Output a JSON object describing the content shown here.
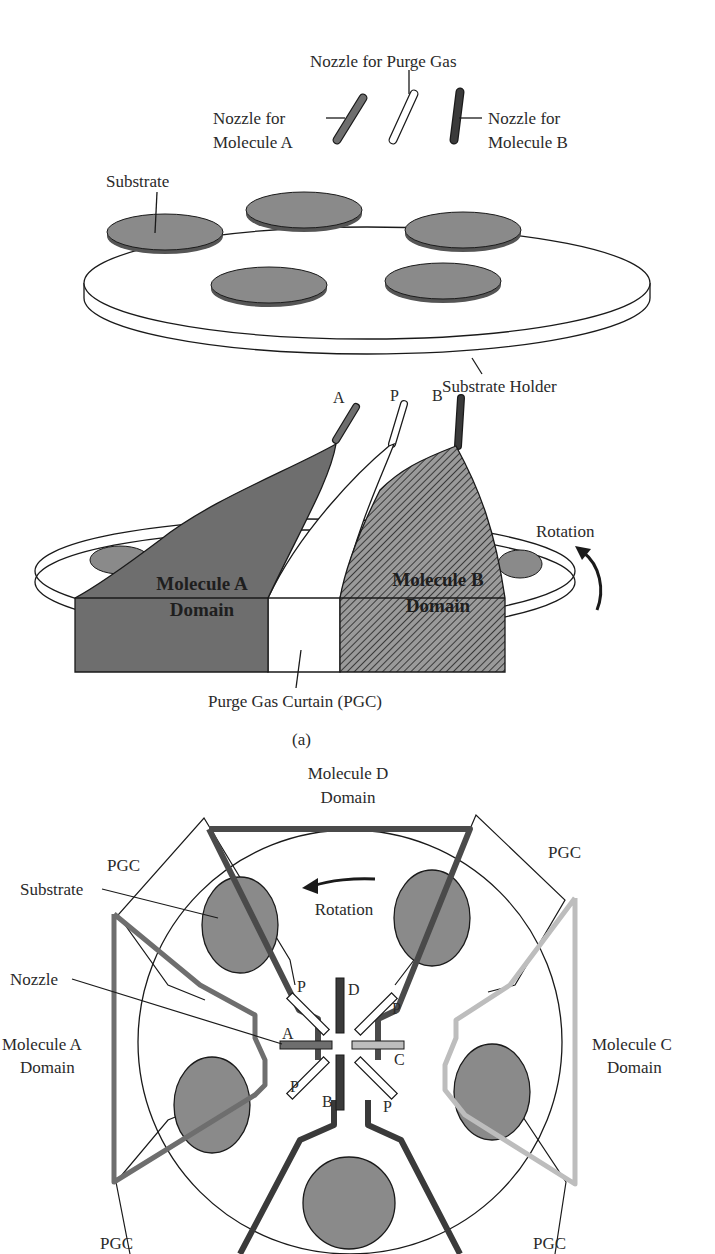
{
  "figure": {
    "part_a": {
      "caption": "(a)",
      "nozzle_labels": {
        "purge": "Nozzle for Purge Gas",
        "molecule_a_line1": "Nozzle for",
        "molecule_a_line2": "Molecule A",
        "molecule_b_line1": "Nozzle for",
        "molecule_b_line2": "Molecule B"
      },
      "substrate_label": "Substrate",
      "holder_label": "Substrate Holder",
      "nozzle_tags": {
        "a": "A",
        "p": "P",
        "b": "B"
      },
      "domain_a_line1": "Molecule A",
      "domain_a_line2": "Domain",
      "domain_b_line1": "Molecule B",
      "domain_b_line2": "Domain",
      "rotation_label": "Rotation",
      "pgc_label": "Purge Gas Curtain (PGC)"
    },
    "part_b": {
      "domain_d_line1": "Molecule D",
      "domain_d_line2": "Domain",
      "domain_a_line1": "Molecule A",
      "domain_a_line2": "Domain",
      "domain_c_line1": "Molecule C",
      "domain_c_line2": "Domain",
      "pgc_label": "PGC",
      "rotation_label": "Rotation",
      "substrate_label": "Substrate",
      "nozzle_label": "Nozzle",
      "nozzle_tags": {
        "a": "A",
        "b": "B",
        "c": "C",
        "d": "D",
        "p": "P"
      }
    },
    "colors": {
      "molecule_a": "#6e6e6e",
      "molecule_b": "#3a3a3a",
      "molecule_c": "#bdbdbd",
      "molecule_d": "#4a4a4a",
      "substrate": "#8a8a8a",
      "outline": "#1a1a1a"
    }
  }
}
